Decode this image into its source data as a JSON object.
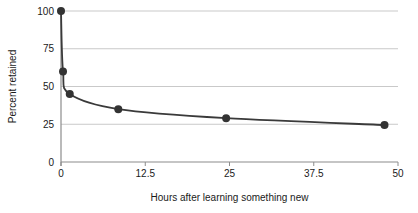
{
  "chart_data": {
    "type": "line",
    "title": "",
    "xlabel": "Hours after learning something new",
    "ylabel": "Percent retained",
    "xlim": [
      0,
      50
    ],
    "ylim": [
      0,
      100
    ],
    "xticks": [
      0,
      12.5,
      25,
      37.5,
      50
    ],
    "xtick_labels": [
      "0",
      "12.5",
      "25",
      "37.5",
      "50"
    ],
    "yticks": [
      0,
      25,
      50,
      75,
      100
    ],
    "ytick_labels": [
      "0",
      "25",
      "50",
      "75",
      "100"
    ],
    "grid": "horizontal",
    "legend": "none",
    "x": [
      0,
      0.3,
      1.3,
      8.5,
      24.5,
      48
    ],
    "values": [
      100,
      60,
      45,
      35,
      29,
      24.5
    ],
    "points": [
      {
        "x": 0,
        "y": 100
      },
      {
        "x": 0.3,
        "y": 60
      },
      {
        "x": 1.3,
        "y": 45
      },
      {
        "x": 8.5,
        "y": 35
      },
      {
        "x": 24.5,
        "y": 29
      },
      {
        "x": 48,
        "y": 24.5
      }
    ],
    "series": [
      {
        "name": "Percent retained",
        "values": [
          100,
          60,
          45,
          35,
          29,
          24.5
        ]
      }
    ],
    "colors": {
      "line": "#3a3a3a",
      "marker": "#333333",
      "grid": "#c9c9c9",
      "axis": "#8c8c8c",
      "text": "#1a1a1a",
      "background": "#ffffff"
    },
    "marker_radius": 4,
    "line_width": 1.8
  }
}
